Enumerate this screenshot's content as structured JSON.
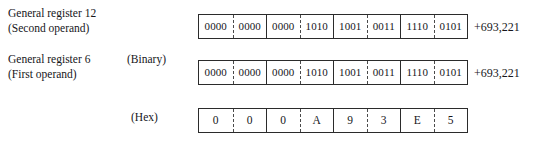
{
  "figure": {
    "rows": [
      {
        "id": "general-register-12",
        "label_lines": [
          "General register 12",
          "(Second operand)"
        ],
        "radix_label": "",
        "radix": "binary",
        "cells": [
          "0000",
          "0000",
          "0000",
          "1010",
          "1001",
          "0011",
          "1110",
          "0101"
        ],
        "decimal_annotation": "+693,221"
      },
      {
        "id": "general-register-6",
        "label_lines": [
          "General register 6",
          "(First operand)"
        ],
        "radix_label": "(Binary)",
        "radix": "binary",
        "cells": [
          "0000",
          "0000",
          "0000",
          "1010",
          "1001",
          "0011",
          "1110",
          "0101"
        ],
        "decimal_annotation": "+693,221"
      },
      {
        "id": "hex-representation",
        "label_lines": [],
        "radix_label": "(Hex)",
        "radix": "hex",
        "cells": [
          "0",
          "0",
          "0",
          "A",
          "9",
          "3",
          "E",
          "5"
        ],
        "decimal_annotation": ""
      }
    ],
    "divider_pattern": [
      "none",
      "dashed",
      "solid",
      "dashed",
      "solid",
      "dashed",
      "solid",
      "dashed"
    ],
    "colors": {
      "border": "#2b2b2b",
      "divider_dashed": "#4a4a4a",
      "text": "#16161a",
      "background": "#ffffff"
    }
  }
}
